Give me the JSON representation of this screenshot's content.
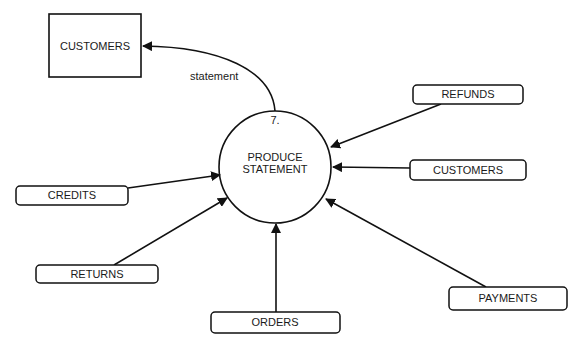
{
  "diagram": {
    "type": "data-flow-diagram",
    "process": {
      "number": "7.",
      "label_line1": "PRODUCE",
      "label_line2": "STATEMENT"
    },
    "external_entity": {
      "label": "CUSTOMERS"
    },
    "output_flow": {
      "label": "statement",
      "from": "PRODUCE STATEMENT",
      "to": "CUSTOMERS"
    },
    "data_stores": [
      {
        "id": "refunds",
        "label": "REFUNDS"
      },
      {
        "id": "customers",
        "label": "CUSTOMERS"
      },
      {
        "id": "credits",
        "label": "CREDITS"
      },
      {
        "id": "returns",
        "label": "RETURNS"
      },
      {
        "id": "orders",
        "label": "ORDERS"
      },
      {
        "id": "payments",
        "label": "PAYMENTS"
      }
    ],
    "colors": {
      "line": "#111111",
      "background": "#ffffff"
    }
  }
}
